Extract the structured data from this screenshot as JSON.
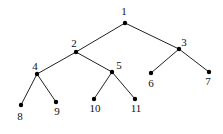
{
  "diagram": {
    "type": "binary-tree",
    "nodes": [
      {
        "id": "1",
        "label": "1",
        "x": 125,
        "y": 23,
        "lx": 124,
        "ly": 15
      },
      {
        "id": "2",
        "label": "2",
        "x": 76,
        "y": 52,
        "lx": 74,
        "ly": 47
      },
      {
        "id": "3",
        "label": "3",
        "x": 179,
        "y": 49,
        "lx": 184,
        "ly": 46
      },
      {
        "id": "4",
        "label": "4",
        "x": 37,
        "y": 74,
        "lx": 35,
        "ly": 70
      },
      {
        "id": "5",
        "label": "5",
        "x": 112,
        "y": 72,
        "lx": 119,
        "ly": 69
      },
      {
        "id": "6",
        "label": "6",
        "x": 151,
        "y": 73,
        "lx": 151,
        "ly": 87
      },
      {
        "id": "7",
        "label": "7",
        "x": 209,
        "y": 72,
        "lx": 208,
        "ly": 85
      },
      {
        "id": "8",
        "label": "8",
        "x": 21,
        "y": 105,
        "lx": 20,
        "ly": 120
      },
      {
        "id": "9",
        "label": "9",
        "x": 56,
        "y": 102,
        "lx": 57,
        "ly": 115
      },
      {
        "id": "10",
        "label": "10",
        "x": 94,
        "y": 99,
        "lx": 95,
        "ly": 112
      },
      {
        "id": "11",
        "label": "11",
        "x": 135,
        "y": 99,
        "lx": 136,
        "ly": 112
      }
    ],
    "edges": [
      [
        "1",
        "2"
      ],
      [
        "1",
        "3"
      ],
      [
        "2",
        "4"
      ],
      [
        "2",
        "5"
      ],
      [
        "3",
        "6"
      ],
      [
        "3",
        "7"
      ],
      [
        "4",
        "8"
      ],
      [
        "4",
        "9"
      ],
      [
        "5",
        "10"
      ],
      [
        "5",
        "11"
      ]
    ]
  }
}
